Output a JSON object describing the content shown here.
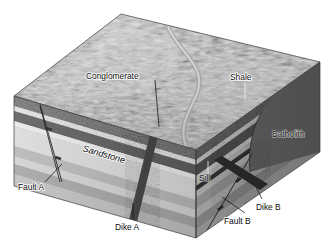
{
  "figure": {
    "kind": "geologic-block-diagram",
    "background_color": "#ffffff",
    "width": 333,
    "height": 249
  },
  "labels": {
    "conglomerate": "Conglomerate",
    "shale": "Shale",
    "sandstone": "Sandstone",
    "batholith": "Batholith",
    "sill": "Sill",
    "fault_a": "Fault A",
    "dike_a": "Dike A",
    "dike_b": "Dike B",
    "fault_b": "Fault B"
  },
  "surfaces": {
    "top_surface_name": "eroded-topographic-surface",
    "left_face_name": "front-left-cross-section",
    "right_face_name": "front-right-cross-section"
  },
  "palette": {
    "terrain_base": "#b9b9b9",
    "terrain_shadow": "#4a4a4a",
    "terrain_highlight": "#e8e8e8",
    "conglomerate_band": "#6f6f6f",
    "shale_band": "#4f4f4f",
    "sandstone_band": "#d8d8d8",
    "limestone_band": "#c2c2c2",
    "pale_band": "#eaeaea",
    "mid_band": "#aeaeae",
    "dark_band": "#8a8a8a",
    "batholith": "#6a6a6a",
    "dike": "#2b2b2b",
    "sill": "#242424",
    "fault_line": "#141414",
    "outline": "#3a3a3a",
    "label_text": "#0a0a0a"
  },
  "units": [
    {
      "name": "Conglomerate",
      "role": "uppermost-sedimentary-unit",
      "color": "#6f6f6f"
    },
    {
      "name": "Shale",
      "role": "dark-sedimentary-unit",
      "color": "#4f4f4f"
    },
    {
      "name": "Sandstone",
      "role": "thick-pale-sedimentary-unit",
      "color": "#d8d8d8"
    },
    {
      "name": "Sill",
      "role": "concordant-igneous-intrusion",
      "color": "#242424"
    },
    {
      "name": "Dike A",
      "role": "discordant-igneous-intrusion",
      "color": "#2b2b2b"
    },
    {
      "name": "Dike B",
      "role": "discordant-igneous-intrusion",
      "color": "#2b2b2b"
    },
    {
      "name": "Batholith",
      "role": "large-igneous-intrusion",
      "color": "#6a6a6a"
    },
    {
      "name": "Fault A",
      "role": "normal-fault",
      "color": "#141414"
    },
    {
      "name": "Fault B",
      "role": "normal-fault",
      "color": "#141414"
    }
  ]
}
